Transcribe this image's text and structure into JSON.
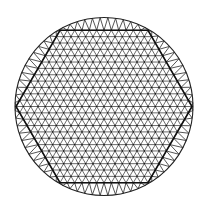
{
  "diagram": {
    "type": "triangular-mesh-in-circle",
    "colors": {
      "background": "#ffffff",
      "mesh": "#3a3a3a",
      "hexagon": "#111111",
      "circle": "#222222",
      "nodes": "#111111"
    },
    "circle": {
      "cx": 104,
      "cy": 106.5,
      "r": 89
    },
    "hexagon": {
      "cx": 104,
      "cy": 106.5,
      "circumradius": 88,
      "orientation": "flat-top",
      "subdivisions": 12
    },
    "boundary_ring": {
      "points_on_circle": 72
    }
  }
}
